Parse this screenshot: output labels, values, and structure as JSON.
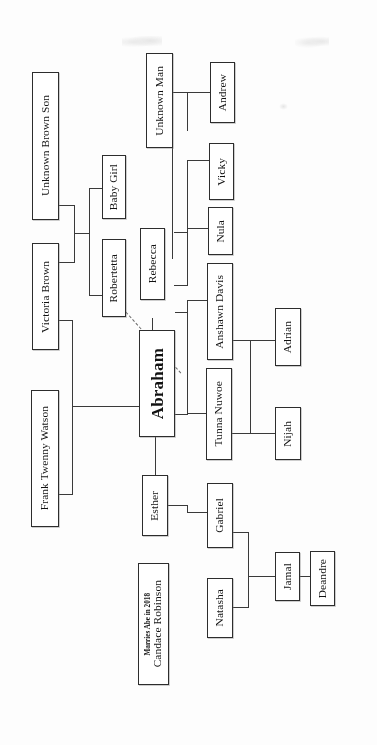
{
  "diagram": {
    "orientation": "rotated-90-ccw",
    "page_background": "#ffffff",
    "line_color": "#3a3a3a",
    "box_border_color": "#2d2d2d"
  },
  "nodes": {
    "unknown_brown_son": {
      "label": "Unknown Brown Son"
    },
    "victoria_brown": {
      "label": "Victoria Brown"
    },
    "frank_twenny_watson": {
      "label": "Frank Twenny Watson"
    },
    "candace_robinson": {
      "label": "Candace Robinson",
      "note": "Marries Abe in 2018"
    },
    "baby_girl": {
      "label": "Baby Girl"
    },
    "robertetta": {
      "label": "Robertetta"
    },
    "unknown_man": {
      "label": "Unknown Man"
    },
    "rebecca": {
      "label": "Rebecca"
    },
    "abraham": {
      "label": "Abraham"
    },
    "esther": {
      "label": "Esther"
    },
    "andrew": {
      "label": "Andrew"
    },
    "vicky": {
      "label": "Vicky"
    },
    "nula": {
      "label": "Nula"
    },
    "anshawn_davis": {
      "label": "Anshawn Davis"
    },
    "tunna_nuwoe": {
      "label": "Tunna Nuwoe"
    },
    "gabriel": {
      "label": "Gabriel"
    },
    "natasha": {
      "label": "Natasha"
    },
    "adrian": {
      "label": "Adrian"
    },
    "nijah": {
      "label": "Nijah"
    },
    "jamal": {
      "label": "Jamal"
    },
    "deandre": {
      "label": "Deandre"
    }
  },
  "generations": [
    {
      "name": "generation-1",
      "members": [
        "Unknown Brown Son",
        "Victoria Brown",
        "Frank Twenny Watson",
        "Candace Robinson"
      ]
    },
    {
      "name": "generation-2",
      "members": [
        "Baby Girl",
        "Robertetta",
        "Unknown Man",
        "Rebecca",
        "Abraham",
        "Esther"
      ]
    },
    {
      "name": "generation-3",
      "members": [
        "Andrew",
        "Vicky",
        "Nula",
        "Anshawn Davis",
        "Tunna Nuwoe",
        "Gabriel",
        "Natasha"
      ]
    },
    {
      "name": "generation-4",
      "members": [
        "Adrian",
        "Nijah",
        "Jamal",
        "Deandre"
      ]
    }
  ],
  "relations": [
    {
      "from": "Victoria Brown",
      "to": "Unknown Brown Son",
      "type": "partners"
    },
    {
      "from": "Victoria Brown",
      "to": "Baby Girl",
      "type": "child"
    },
    {
      "from": "Victoria Brown",
      "to": "Robertetta",
      "type": "child"
    },
    {
      "from": "Robertetta",
      "to": "Abraham",
      "type": "dashed-link"
    },
    {
      "from": "Frank Twenny Watson",
      "to": "Abraham",
      "type": "child"
    },
    {
      "from": "Abraham",
      "to": "Rebecca",
      "type": "partners"
    },
    {
      "from": "Abraham",
      "to": "Esther",
      "type": "partners"
    },
    {
      "from": "Unknown Man",
      "to": "Andrew",
      "type": "child"
    },
    {
      "from": "Rebecca",
      "to": "Vicky",
      "type": "child"
    },
    {
      "from": "Rebecca",
      "to": "Nula",
      "type": "child"
    },
    {
      "from": "Abraham",
      "to": "Anshawn Davis",
      "type": "child"
    },
    {
      "from": "Abraham",
      "to": "Tunna Nuwoe",
      "type": "child"
    },
    {
      "from": "Anshawn Davis",
      "to": "Adrian",
      "type": "child"
    },
    {
      "from": "Tunna Nuwoe",
      "to": "Nijah",
      "type": "child"
    },
    {
      "from": "Esther",
      "to": "Gabriel",
      "type": "child"
    },
    {
      "from": "Gabriel",
      "to": "Natasha",
      "type": "partners"
    },
    {
      "from": "Gabriel",
      "to": "Jamal",
      "type": "child"
    },
    {
      "from": "Jamal",
      "to": "Deandre",
      "type": "sibling-link"
    }
  ]
}
